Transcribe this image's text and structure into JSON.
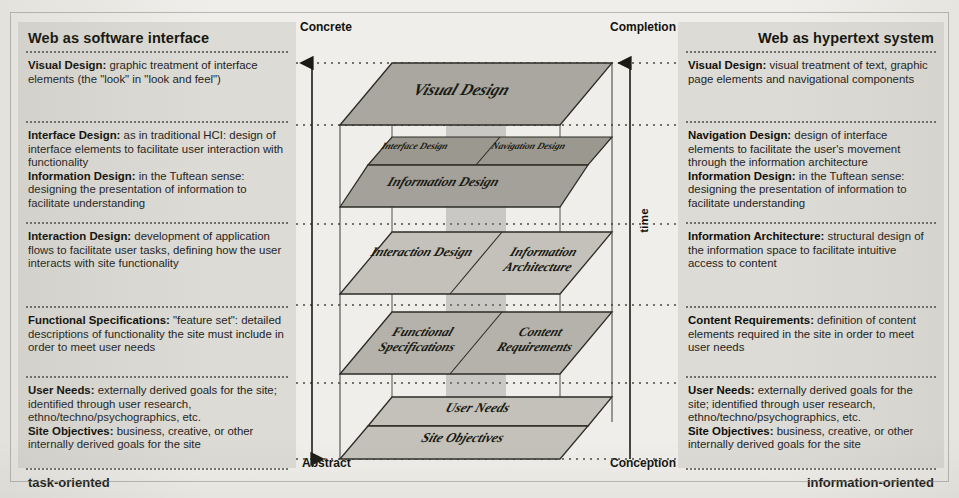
{
  "figure": {
    "left_column": {
      "heading": "Web as software interface",
      "orientation": "task-oriented",
      "cells": [
        [
          {
            "term": "Visual Design:",
            "text": " graphic treatment of interface elements (the \"look\" in \"look and feel\")"
          }
        ],
        [
          {
            "term": "Interface Design:",
            "text": " as in traditional HCI: design of interface elements to facilitate user interaction with functionality"
          },
          {
            "term": "Information Design:",
            "text": " in the Tuftean sense: designing the presentation of information to facilitate understanding"
          }
        ],
        [
          {
            "term": "Interaction Design:",
            "text": " development of application flows to facilitate user tasks, defining how the user interacts with site functionality"
          }
        ],
        [
          {
            "term": "Functional Specifications:",
            "text": " \"feature set\": detailed descriptions of functionality the site must include in order to meet user needs"
          }
        ],
        [
          {
            "term": "User Needs:",
            "text": " externally derived goals for the site; identified through user research, ethno/techno/psychographics, etc."
          },
          {
            "term": "Site Objectives:",
            "text": " business, creative, or other internally derived goals for the site"
          }
        ]
      ]
    },
    "right_column": {
      "heading": "Web as hypertext system",
      "orientation": "information-oriented",
      "cells": [
        [
          {
            "term": "Visual Design:",
            "text": " visual treatment of text, graphic page elements and navigational components"
          }
        ],
        [
          {
            "term": "Navigation Design:",
            "text": " design of interface elements to facilitate the user's movement through the information architecture"
          },
          {
            "term": "Information Design:",
            "text": " in the Tuftean sense: designing the presentation of information to facilitate understanding"
          }
        ],
        [
          {
            "term": "Information Architecture:",
            "text": " structural design of the information space to facilitate intuitive access to content"
          }
        ],
        [
          {
            "term": "Content Requirements:",
            "text": " definition of content elements required in the site in order to meet user needs"
          }
        ],
        [
          {
            "term": "User Needs:",
            "text": " externally derived goals for the site; identified through user research, ethno/techno/psychographics, etc."
          },
          {
            "term": "Site Objectives:",
            "text": " business, creative, or other internally derived goals for the site"
          }
        ]
      ]
    },
    "axes": {
      "left_top": "Concrete",
      "left_bottom": "Abstract",
      "right_top": "Completion",
      "right_bottom": "Conception",
      "time_label": "time"
    },
    "planes": [
      {
        "id": "visual-design",
        "label": "Visual Design",
        "span": "full"
      },
      {
        "id": "interface-design",
        "label": "Interface Design",
        "span": "left"
      },
      {
        "id": "navigation-design",
        "label": "Navigation Design",
        "span": "right"
      },
      {
        "id": "information-design",
        "label": "Information Design",
        "span": "full"
      },
      {
        "id": "interaction-design",
        "label": "Interaction Design",
        "span": "left"
      },
      {
        "id": "information-architecture",
        "label": "Information Architecture",
        "span": "right"
      },
      {
        "id": "functional-specifications",
        "label": "Functional Specifications",
        "span": "left"
      },
      {
        "id": "content-requirements",
        "label": "Content Requirements",
        "span": "right"
      },
      {
        "id": "user-needs",
        "label": "User Needs",
        "span": "full"
      },
      {
        "id": "site-objectives",
        "label": "Site Objectives",
        "span": "full"
      }
    ],
    "colors": {
      "paper": "#efeeea",
      "panel": "#dddbd5",
      "plane_dark": "#a9a7a0",
      "plane_light": "#c9c7c0",
      "ink": "#1b1b1b"
    }
  }
}
